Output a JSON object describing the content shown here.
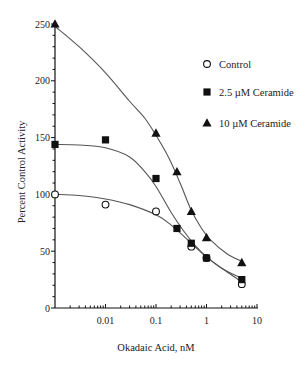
{
  "chart_data": {
    "type": "scatter",
    "title": "",
    "xlabel": "Okadaic Acid, nM",
    "ylabel": "Percent Control Activity",
    "xscale": "log",
    "xlim": [
      0.001,
      10
    ],
    "ylim": [
      0,
      250
    ],
    "x_ticks": [
      {
        "value": 0.01,
        "label": "0.01"
      },
      {
        "value": 0.1,
        "label": "0.1"
      },
      {
        "value": 1,
        "label": "1"
      },
      {
        "value": 10,
        "label": "10"
      }
    ],
    "y_ticks": [
      {
        "value": 0,
        "label": "0"
      },
      {
        "value": 50,
        "label": "50"
      },
      {
        "value": 100,
        "label": "100"
      },
      {
        "value": 150,
        "label": "150"
      },
      {
        "value": 200,
        "label": "200"
      },
      {
        "value": 250,
        "label": "250"
      }
    ],
    "grid": false,
    "legend_position": "upper right",
    "series": [
      {
        "name": "Control",
        "marker": "open-circle",
        "x": [
          0.001,
          0.01,
          0.1,
          0.5,
          1,
          5
        ],
        "y": [
          100,
          91,
          85,
          54,
          44,
          21
        ],
        "fit_curve": [
          [
            0.001,
            100
          ],
          [
            0.003,
            99
          ],
          [
            0.01,
            96
          ],
          [
            0.03,
            91
          ],
          [
            0.1,
            82
          ],
          [
            0.2,
            73
          ],
          [
            0.4,
            61
          ],
          [
            0.7,
            51
          ],
          [
            1,
            45
          ],
          [
            2,
            35
          ],
          [
            5,
            23
          ]
        ]
      },
      {
        "name": "2.5 µM Ceramide",
        "marker": "filled-square",
        "x": [
          0.001,
          0.01,
          0.1,
          0.26,
          0.5,
          1,
          5
        ],
        "y": [
          144,
          148,
          114,
          70,
          57,
          44,
          25
        ],
        "fit_curve": [
          [
            0.001,
            144
          ],
          [
            0.003,
            143.5
          ],
          [
            0.01,
            141
          ],
          [
            0.03,
            133
          ],
          [
            0.06,
            120
          ],
          [
            0.1,
            107
          ],
          [
            0.2,
            84
          ],
          [
            0.35,
            68
          ],
          [
            0.6,
            55
          ],
          [
            1,
            45
          ],
          [
            2,
            35
          ],
          [
            5,
            26
          ]
        ]
      },
      {
        "name": "10 µM Ceramide",
        "marker": "filled-triangle",
        "x": [
          0.001,
          0.1,
          0.26,
          0.5,
          1,
          5
        ],
        "y": [
          250,
          154,
          120,
          85,
          62,
          40
        ],
        "fit_curve": [
          [
            0.001,
            248
          ],
          [
            0.003,
            230
          ],
          [
            0.01,
            207
          ],
          [
            0.03,
            182
          ],
          [
            0.06,
            167
          ],
          [
            0.1,
            152
          ],
          [
            0.18,
            132
          ],
          [
            0.3,
            110
          ],
          [
            0.5,
            86
          ],
          [
            0.8,
            70
          ],
          [
            1.2,
            60
          ],
          [
            2.5,
            48
          ],
          [
            5,
            41
          ]
        ]
      }
    ]
  },
  "legend": [
    {
      "label": "Control",
      "marker": "open-circle"
    },
    {
      "label": "2.5 µM Ceramide",
      "marker": "filled-square"
    },
    {
      "label": "10 µM Ceramide",
      "marker": "filled-triangle"
    }
  ]
}
